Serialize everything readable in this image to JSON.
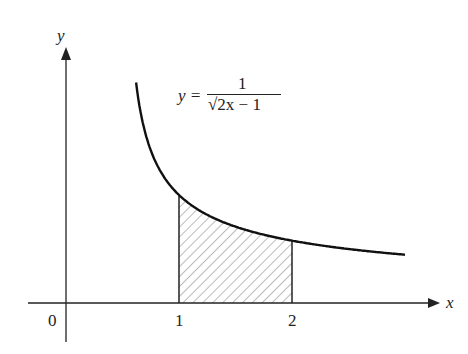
{
  "figure": {
    "x_axis_label": "x",
    "y_axis_label": "y",
    "origin_label": "0",
    "tick_labels": [
      "1",
      "2"
    ],
    "equation": {
      "lhs": "y =",
      "numerator": "1",
      "denominator": "√2x − 1"
    },
    "function": "y = 1/sqrt(2x - 1)",
    "shaded_region": {
      "from": 1,
      "to": 2,
      "style": "hatched"
    },
    "colors": {
      "ink": "#222222",
      "background": "#ffffff"
    }
  }
}
